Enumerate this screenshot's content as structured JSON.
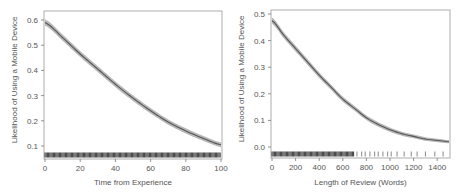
{
  "chart_data": [
    {
      "type": "line",
      "title": "",
      "xlabel": "Time from Experience",
      "ylabel": "Likelihood of Using a Mobile Device",
      "xlim": [
        0,
        100
      ],
      "ylim": [
        0.07,
        0.62
      ],
      "xticks": [
        "0",
        "20",
        "40",
        "60",
        "80",
        "100"
      ],
      "yticks": [
        "0.1",
        "0.2",
        "0.3",
        "0.4",
        "0.5",
        "0.6"
      ],
      "grid": false,
      "confidence_band": true,
      "rug": "dense across 0-100",
      "x": [
        0,
        10,
        20,
        30,
        40,
        50,
        60,
        70,
        80,
        90,
        100
      ],
      "values": [
        0.59,
        0.53,
        0.465,
        0.405,
        0.345,
        0.29,
        0.24,
        0.195,
        0.16,
        0.13,
        0.105
      ]
    },
    {
      "type": "line",
      "title": "",
      "xlabel": "Length of Review (Words)",
      "ylabel": "Likelihood of Using a Mobile Device",
      "xlim": [
        0,
        1500
      ],
      "ylim": [
        -0.03,
        0.51
      ],
      "xticks": [
        "0",
        "200",
        "400",
        "600",
        "800",
        "1000",
        "1200",
        "1400"
      ],
      "yticks": [
        "0.0",
        "0.1",
        "0.2",
        "0.3",
        "0.4",
        "0.5"
      ],
      "grid": false,
      "confidence_band": true,
      "rug": "dense 0-700, sparse 700-1500",
      "x": [
        0,
        100,
        200,
        300,
        400,
        500,
        600,
        700,
        800,
        900,
        1000,
        1100,
        1200,
        1300,
        1400,
        1500
      ],
      "values": [
        0.475,
        0.42,
        0.37,
        0.32,
        0.27,
        0.225,
        0.18,
        0.145,
        0.11,
        0.085,
        0.065,
        0.05,
        0.04,
        0.03,
        0.025,
        0.02
      ]
    }
  ]
}
